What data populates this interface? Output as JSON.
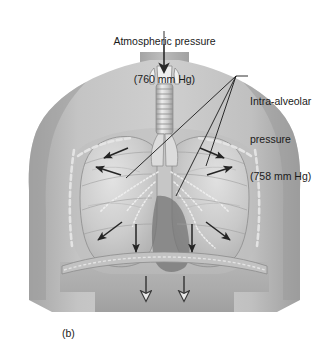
{
  "figure": {
    "panel_label": "(b)",
    "labels": {
      "atmospheric": {
        "line1": "Atmospheric pressure",
        "line2": "(760 mm Hg)",
        "value": "760 mm Hg"
      },
      "intra_alveolar": {
        "line1": "Intra-alveolar",
        "line2": "pressure",
        "line3": "(758 mm Hg)",
        "value": "758 mm Hg"
      }
    },
    "colors": {
      "background": "#ffffff",
      "text": "#1a1a1a",
      "leader_line": "#1a1a1a",
      "body_light": "#d6d6d6",
      "body_mid": "#b3b3b3",
      "body_dark": "#8f8f8f",
      "lung": "#c9c9c9",
      "heart_shadow": "#767676",
      "arrow_dark": "#242424",
      "arrow_hollow_fill": "#e8e8e8",
      "arrow_hollow_stroke": "#3a3a3a"
    },
    "anatomy": {
      "larynx": "larynx",
      "trachea": "trachea",
      "left_lung": "left lung",
      "right_lung": "right lung",
      "ribcage": "rib cage",
      "diaphragm": "diaphragm",
      "bronchi": "bronchial tree",
      "heart_shadow": "heart"
    },
    "arrows": {
      "inflow": "downward arrow into larynx",
      "lung_outward_count": 6,
      "diaphragm_down_count": 2
    }
  }
}
